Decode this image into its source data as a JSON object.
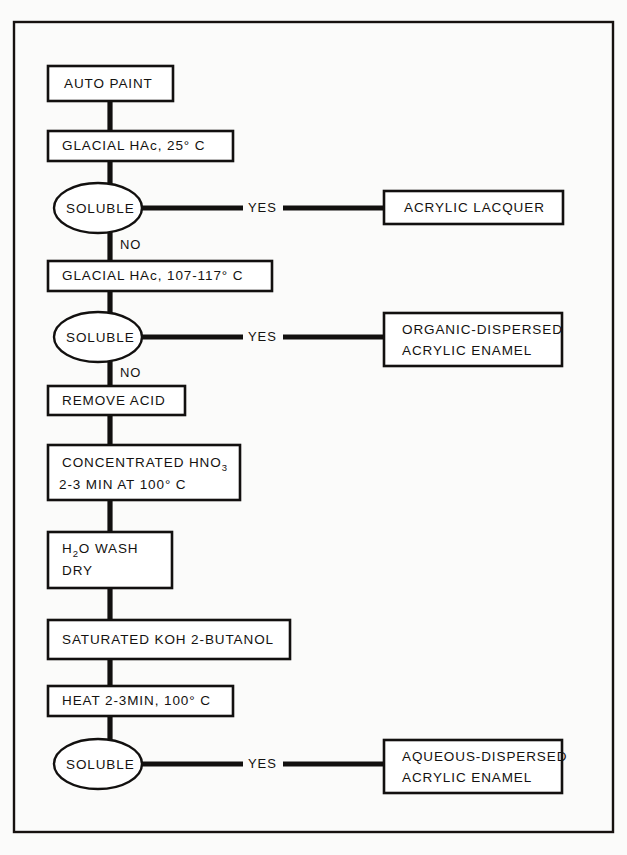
{
  "diagram": {
    "colors": {
      "ink": "#12100f",
      "paper": "#fbfbfa",
      "node_fill": "#ffffff"
    },
    "nodes": {
      "start": {
        "label": "AUTO PAINT",
        "shape": "rect"
      },
      "step_hac_25": {
        "label": "GLACIAL  HAc,  25° C",
        "shape": "rect"
      },
      "decision_1": {
        "label": "SOLUBLE",
        "shape": "ellipse"
      },
      "result_1": {
        "label": "ACRYLIC  LACQUER",
        "shape": "rect"
      },
      "step_hac_107": {
        "label": "GLACIAL  HAc,  107-117° C",
        "shape": "rect"
      },
      "decision_2": {
        "label": "SOLUBLE",
        "shape": "ellipse"
      },
      "result_2_line1": "ORGANIC-DISPERSED",
      "result_2_line2": "ACRYLIC  ENAMEL",
      "step_remove_acid": {
        "label": "REMOVE  ACID",
        "shape": "rect"
      },
      "step_hno3_line1_a": "CONCENTRATED  HNO",
      "step_hno3_line1_sub": "3",
      "step_hno3_line2": "2-3  MIN  AT  100° C",
      "step_wash_line1_a": "H",
      "step_wash_line1_sub": "2",
      "step_wash_line1_b": "O  WASH",
      "step_wash_line2": "DRY",
      "step_koh": {
        "label": "SATURATED  KOH    2-BUTANOL",
        "shape": "rect"
      },
      "step_heat": {
        "label": "HEAT  2-3MIN,  100° C",
        "shape": "rect"
      },
      "decision_3": {
        "label": "SOLUBLE",
        "shape": "ellipse"
      },
      "result_3_line1": "AQUEOUS-DISPERSED",
      "result_3_line2": "ACRYLIC  ENAMEL"
    },
    "edge_labels": {
      "yes_1": "YES",
      "no_1": "NO",
      "yes_2": "YES",
      "no_2": "NO",
      "yes_3": "YES"
    }
  }
}
